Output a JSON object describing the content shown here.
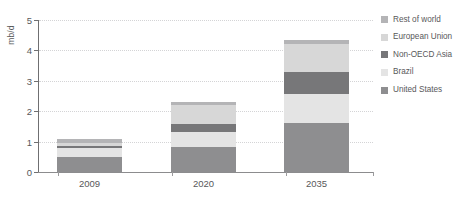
{
  "chart_data": {
    "type": "bar",
    "stacked": true,
    "title": "",
    "subtitle": "",
    "xlabel": "",
    "ylabel": "mb/d",
    "categories": [
      "2009",
      "2020",
      "2035"
    ],
    "ylim": [
      0,
      5
    ],
    "yticks": [
      0,
      1,
      2,
      3,
      4,
      5
    ],
    "ytick_labels": [
      "0",
      "1",
      "2",
      "3",
      "4",
      "5"
    ],
    "grid": true,
    "legend_position": "right",
    "series": [
      {
        "name": "United States",
        "color": "#8e8e90",
        "values": [
          0.5,
          0.82,
          1.6
        ]
      },
      {
        "name": "Brazil",
        "color": "#e4e4e4",
        "values": [
          0.28,
          0.48,
          0.95
        ]
      },
      {
        "name": "Non-OECD Asia",
        "color": "#777779",
        "values": [
          0.07,
          0.27,
          0.75
        ]
      },
      {
        "name": "European Union",
        "color": "#d7d7d7",
        "values": [
          0.1,
          0.63,
          0.9
        ]
      },
      {
        "name": "Rest of world",
        "color": "#b4b4b6",
        "values": [
          0.15,
          0.1,
          0.15
        ]
      }
    ],
    "totals": [
      1.1,
      2.3,
      4.35
    ],
    "legend_order": [
      "Rest of world",
      "European Union",
      "Non-OECD Asia",
      "Brazil",
      "United States"
    ],
    "colors": {
      "rest_of_world": "#b4b4b6",
      "european_union": "#d7d7d7",
      "non_oecd_asia": "#777779",
      "brazil": "#e4e4e4",
      "united_states": "#8e8e90",
      "axis": "#6f6f71",
      "gridline": "#d4d4d6",
      "text": "#58585a"
    }
  }
}
